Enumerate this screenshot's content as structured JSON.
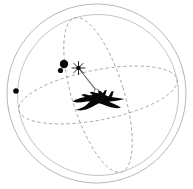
{
  "figure": {
    "background_color": "#ffffff",
    "width": 193,
    "height": 189
  },
  "palette": {
    "sphere_stroke": "#a9a9ac",
    "inner_sphere_stroke": "#b4b4b8",
    "great_circle_stroke": "#9e9ea2",
    "ray_stroke": "#5a5a5a",
    "contact_fill": "#0a0a0a",
    "aircraft_fill": "#080808",
    "background": "#ffffff"
  },
  "chart_data": {
    "type": "scatter",
    "title": "",
    "xlabel": "",
    "ylabel": "",
    "grid": false,
    "legend": "none",
    "xlim": [
      0,
      193
    ],
    "ylim": [
      0,
      189
    ],
    "spheres": [
      {
        "name": "outer-envelope",
        "cx": 96.5,
        "cy": 93.5,
        "r": 89.5,
        "style": "solid"
      },
      {
        "name": "inner-envelope",
        "cx": 98.0,
        "cy": 95.0,
        "r": 80.5,
        "style": "solid"
      }
    ],
    "great_circles": [
      {
        "name": "equatorial-arc",
        "cx": 98.0,
        "cy": 95.0,
        "rx": 80.5,
        "ry": 25.0,
        "rotation": -11,
        "style": "dashed"
      },
      {
        "name": "meridian-arc",
        "cx": 98.0,
        "cy": 95.0,
        "rx": 26.0,
        "ry": 80.5,
        "rotation": -17,
        "style": "dashed"
      }
    ],
    "contacts": [
      {
        "label": "contact-1",
        "x": 64,
        "y": 64,
        "radius": 4.2
      },
      {
        "label": "contact-2",
        "x": 60.5,
        "y": 70.5,
        "radius": 2.6
      },
      {
        "label": "contact-3",
        "x": 16,
        "y": 91,
        "radius": 2.8
      }
    ],
    "sensor_node": {
      "label": "sensor-burst",
      "x": 78.5,
      "y": 68.0,
      "radius": 2.2,
      "spokes": 8
    },
    "platform_node": {
      "label": "platform-ring",
      "x": 96.5,
      "y": 91.5,
      "radius": 2.4
    },
    "rays": [
      {
        "from": [
          78.5,
          68.0
        ],
        "to": [
          96.5,
          91.5
        ]
      },
      {
        "from": [
          78.5,
          68.0
        ],
        "to": [
          103.0,
          98.0
        ]
      }
    ],
    "aircraft": {
      "label": "fighter-jet-silhouette",
      "center_x": 97,
      "center_y": 101,
      "heading": "right",
      "span": 56
    }
  }
}
